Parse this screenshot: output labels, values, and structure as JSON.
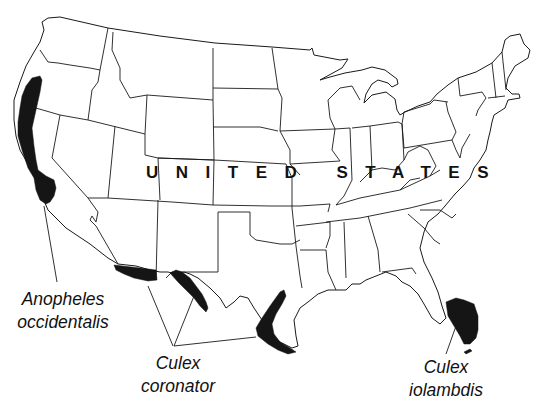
{
  "map": {
    "country_label": "UNITED STATES",
    "fill_color": "#151515",
    "border_color": "#1a1a1a",
    "background": "#ffffff"
  },
  "legend_labels": [
    {
      "genus": "Anopheles",
      "species": "occidentalis",
      "region": "Pacific coast (WA/OR/CA)"
    },
    {
      "genus": "Culex",
      "species": "coronator",
      "region": "Southern Arizona, West Texas, South Texas coast"
    },
    {
      "genus": "Culex",
      "species": "iolambdis",
      "region": "Southern Florida"
    }
  ]
}
